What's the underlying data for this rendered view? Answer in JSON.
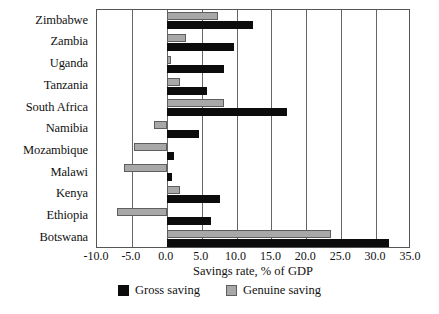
{
  "chart_data": {
    "type": "bar",
    "orientation": "horizontal",
    "title": "",
    "xlabel": "Savings rate, % of GDP",
    "ylabel": "",
    "xlim": [
      -10.0,
      35.0
    ],
    "xticks": [
      -10.0,
      -5.0,
      0.0,
      5.0,
      10.0,
      15.0,
      20.0,
      25.0,
      30.0,
      35.0
    ],
    "xtick_labels": [
      "-10.0",
      "-5.0",
      "0.0",
      "5.0",
      "10.0",
      "15.0",
      "20.0",
      "25.0",
      "30.0",
      "35.0"
    ],
    "grid": true,
    "grid_axis": "x",
    "legend_position": "bottom",
    "categories": [
      "Zimbabwe",
      "Zambia",
      "Uganda",
      "Tanzania",
      "South Africa",
      "Namibia",
      "Mozambique",
      "Malawi",
      "Kenya",
      "Ethiopia",
      "Botswana"
    ],
    "series": [
      {
        "name": "Gross saving",
        "color": "#0c0c0c",
        "values": [
          12.3,
          9.6,
          8.2,
          5.8,
          17.2,
          4.6,
          1.0,
          0.8,
          7.7,
          6.4,
          31.8
        ]
      },
      {
        "name": "Genuine saving",
        "color": "#a8a8a8",
        "values": [
          7.3,
          2.7,
          0.6,
          1.9,
          8.2,
          -1.9,
          -4.7,
          -6.2,
          1.9,
          -7.2,
          23.6
        ]
      }
    ]
  },
  "legend": {
    "entries": [
      {
        "label": "Gross saving",
        "swatch": "black-square-icon"
      },
      {
        "label": "Genuine saving",
        "swatch": "grey-square-icon"
      }
    ]
  }
}
